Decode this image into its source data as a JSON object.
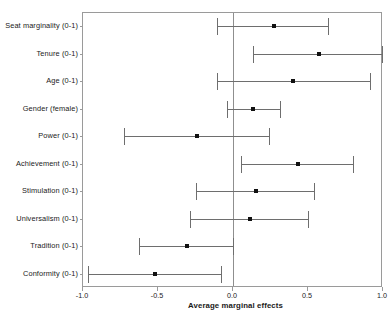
{
  "chart_data": {
    "type": "scatter",
    "subtype": "coefficient-plot-with-error-bars",
    "title": "",
    "xlabel": "Average marginal effects",
    "ylabel": "",
    "xlim": [
      -1.0,
      1.0
    ],
    "xticks": [
      -1.0,
      -0.5,
      0.0,
      0.5,
      1.0
    ],
    "xticklabels": [
      "-1.0",
      "-0.5",
      "0.0",
      "0.5",
      "1.0"
    ],
    "grid": false,
    "legend": null,
    "reference_line": 0.0,
    "categories": [
      "Seat marginality (0-1)",
      "Tenure (0-1)",
      "Age (0-1)",
      "Gender (female)",
      "Power (0-1)",
      "Achievement (0-1)",
      "Stimulation (0-1)",
      "Universalism (0-1)",
      "Tradition (0-1)",
      "Conformity (0-1)"
    ],
    "values": [
      0.27,
      0.57,
      0.4,
      0.13,
      -0.24,
      0.43,
      0.15,
      0.11,
      -0.31,
      -0.52
    ],
    "ci_lower": [
      -0.11,
      0.13,
      -0.11,
      -0.04,
      -0.73,
      0.05,
      -0.25,
      -0.29,
      -0.63,
      -0.97
    ],
    "ci_upper": [
      0.63,
      0.99,
      0.91,
      0.31,
      0.24,
      0.8,
      0.54,
      0.5,
      0.0,
      -0.08
    ],
    "points": [
      {
        "label": "Seat marginality (0-1)",
        "estimate": 0.27,
        "lower": -0.11,
        "upper": 0.63
      },
      {
        "label": "Tenure (0-1)",
        "estimate": 0.57,
        "lower": 0.13,
        "upper": 0.99
      },
      {
        "label": "Age (0-1)",
        "estimate": 0.4,
        "lower": -0.11,
        "upper": 0.91
      },
      {
        "label": "Gender (female)",
        "estimate": 0.13,
        "lower": -0.04,
        "upper": 0.31
      },
      {
        "label": "Power (0-1)",
        "estimate": -0.24,
        "lower": -0.73,
        "upper": 0.24
      },
      {
        "label": "Achievement (0-1)",
        "estimate": 0.43,
        "lower": 0.05,
        "upper": 0.8
      },
      {
        "label": "Stimulation (0-1)",
        "estimate": 0.15,
        "lower": -0.25,
        "upper": 0.54
      },
      {
        "label": "Universalism (0-1)",
        "estimate": 0.11,
        "lower": -0.29,
        "upper": 0.5
      },
      {
        "label": "Tradition (0-1)",
        "estimate": -0.31,
        "lower": -0.63,
        "upper": 0.0
      },
      {
        "label": "Conformity (0-1)",
        "estimate": -0.52,
        "lower": -0.97,
        "upper": -0.08
      }
    ],
    "colors": {
      "point": "#111111",
      "whisker": "#6e6e6e",
      "frame": "#9a9a9a",
      "zero_line": "#8f8f8f",
      "background": "#ffffff",
      "text": "#1a1a1a"
    }
  }
}
